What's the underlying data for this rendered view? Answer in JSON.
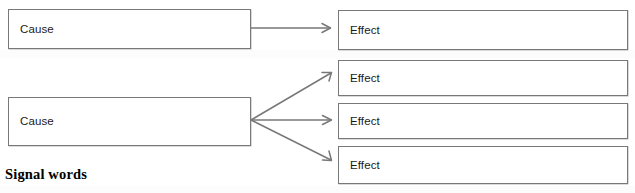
{
  "diagram": {
    "type": "cause-and-effect-graphic-organizer",
    "footer_caption": "Signal words",
    "stroke_color": "#78787a",
    "text_color": "#1a1a1a",
    "background_color": "#ffffff",
    "nodes": [
      {
        "id": "cause-1",
        "label": "Cause",
        "role": "cause"
      },
      {
        "id": "effect-1",
        "label": "Effect",
        "role": "effect"
      },
      {
        "id": "cause-2",
        "label": "Cause",
        "role": "cause"
      },
      {
        "id": "effect-2",
        "label": "Effect",
        "role": "effect"
      },
      {
        "id": "effect-3",
        "label": "Effect",
        "role": "effect"
      },
      {
        "id": "effect-4",
        "label": "Effect",
        "role": "effect"
      }
    ],
    "connectors": [
      {
        "id": "arrow-1",
        "from": "cause-1",
        "to": "effect-1",
        "style": "straight-open-arrow"
      },
      {
        "id": "arrow-2",
        "from": "cause-2",
        "to": "effect-2",
        "style": "fan-open-arrow"
      },
      {
        "id": "arrow-3",
        "from": "cause-2",
        "to": "effect-3",
        "style": "fan-open-arrow"
      },
      {
        "id": "arrow-4",
        "from": "cause-2",
        "to": "effect-4",
        "style": "fan-open-arrow"
      }
    ]
  }
}
